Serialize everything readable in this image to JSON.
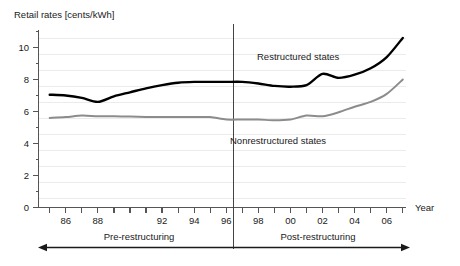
{
  "chart_data": {
    "type": "line",
    "title": "Retail rates [cents/kWh]",
    "ylabel": "Retail rates [cents/kWh]",
    "xlabel": "Year",
    "grid": true,
    "legend_position": "inline-annotation",
    "xlim": [
      1984.3,
      2007.2
    ],
    "ylim": [
      0,
      11.4
    ],
    "yticks": [
      0,
      2,
      4,
      6,
      8,
      10
    ],
    "ytick_labels": [
      "0",
      "2",
      "4",
      "6",
      "8",
      "10"
    ],
    "yminor_ticks": [
      1,
      3,
      5,
      7,
      9,
      11
    ],
    "xticks": [
      1985,
      1986,
      1987,
      1988,
      1989,
      1990,
      1991,
      1992,
      1993,
      1994,
      1995,
      1996,
      1997,
      1998,
      1999,
      2000,
      2001,
      2002,
      2003,
      2004,
      2005,
      2006,
      2007
    ],
    "xtick_labels_shown": [
      "86",
      "88",
      "92",
      "94",
      "96",
      "98",
      "00",
      "02",
      "04",
      "06"
    ],
    "xtick_label_years": [
      1986,
      1988,
      1992,
      1994,
      1996,
      1998,
      2000,
      2002,
      2004,
      2006
    ],
    "x": [
      1985,
      1986,
      1987,
      1988,
      1989,
      1990,
      1991,
      1992,
      1993,
      1994,
      1995,
      1996,
      1997,
      1998,
      1999,
      2000,
      2001,
      2002,
      2003,
      2004,
      2005,
      2006,
      2007
    ],
    "series": [
      {
        "name": "Restructured states",
        "color": "#000000",
        "values": [
          7.05,
          7.0,
          6.85,
          6.6,
          6.95,
          7.2,
          7.45,
          7.65,
          7.8,
          7.85,
          7.85,
          7.85,
          7.85,
          7.75,
          7.6,
          7.55,
          7.65,
          8.35,
          8.1,
          8.3,
          8.7,
          9.4,
          10.6
        ]
      },
      {
        "name": "Nonrestructured states",
        "color": "#8c8c8c",
        "values": [
          5.6,
          5.65,
          5.75,
          5.7,
          5.7,
          5.68,
          5.66,
          5.65,
          5.65,
          5.65,
          5.65,
          5.5,
          5.5,
          5.5,
          5.45,
          5.5,
          5.75,
          5.7,
          5.95,
          6.3,
          6.6,
          7.1,
          8.0
        ]
      }
    ],
    "annotations": [
      {
        "name": "restructured-label",
        "text": "Restructured states",
        "x": 1998.3,
        "y": 9.8
      },
      {
        "name": "nonrestructured-label",
        "text": "Nonrestructured states",
        "x": 1998.3,
        "y": 4.55
      }
    ],
    "period_markers": {
      "divider_year": 1997,
      "pre_label": "Pre-restructuring",
      "post_label": "Post-restructuring"
    }
  },
  "axis": {
    "y_title": "Retail rates [cents/kWh]",
    "x_title": "Year"
  }
}
